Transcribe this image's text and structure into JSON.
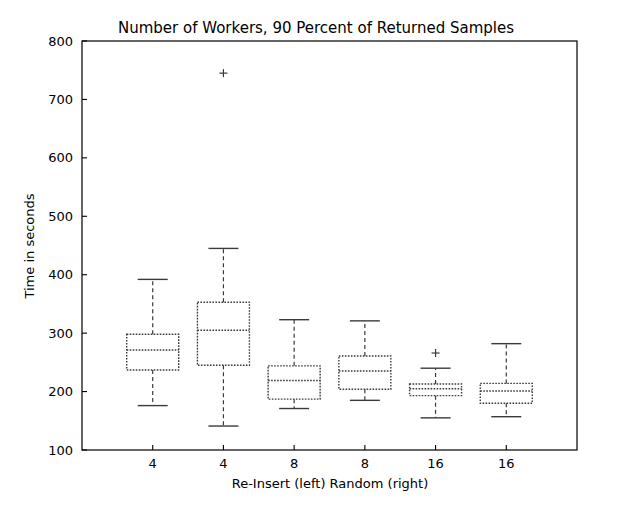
{
  "chart_data": {
    "type": "box",
    "title": "Number of Workers, 90 Percent of Returned Samples",
    "xlabel": "Re-Insert (left)   Random (right)",
    "ylabel": "Time in seconds",
    "ylim": [
      100,
      800
    ],
    "xlim": [
      0,
      7
    ],
    "grid": false,
    "legend": null,
    "yticks": [
      100,
      200,
      300,
      400,
      500,
      600,
      700,
      800
    ],
    "ytick_labels": [
      "100",
      "200",
      "300",
      "400",
      "500",
      "600",
      "700",
      "800"
    ],
    "xticks": [
      1,
      2,
      3,
      4,
      5,
      6
    ],
    "categories": [
      "4",
      "4",
      "8",
      "8",
      "16",
      "16"
    ],
    "xtick_labels": [
      "4",
      "4",
      "8",
      "8",
      "16",
      "16"
    ],
    "box_color": "#3a3a3a",
    "median_color": "#3a3a3a",
    "whisker_color": "#3a3a3a",
    "outlier_marker": "+",
    "boxes": [
      {
        "label": "4",
        "group": "Re-Insert",
        "whisker_low": 176,
        "q1": 237,
        "median": 271,
        "q3": 298,
        "whisker_high": 392,
        "outliers": []
      },
      {
        "label": "4",
        "group": "Random",
        "whisker_low": 141,
        "q1": 245,
        "median": 305,
        "q3": 353,
        "whisker_high": 445,
        "outliers": [
          745
        ]
      },
      {
        "label": "8",
        "group": "Re-Insert",
        "whisker_low": 171,
        "q1": 187,
        "median": 219,
        "q3": 244,
        "whisker_high": 323,
        "outliers": []
      },
      {
        "label": "8",
        "group": "Random",
        "whisker_low": 185,
        "q1": 204,
        "median": 235,
        "q3": 261,
        "whisker_high": 321,
        "outliers": []
      },
      {
        "label": "16",
        "group": "Re-Insert",
        "whisker_low": 155,
        "q1": 193,
        "median": 205,
        "q3": 213,
        "whisker_high": 240,
        "outliers": [
          266
        ]
      },
      {
        "label": "16",
        "group": "Random",
        "whisker_low": 157,
        "q1": 180,
        "median": 201,
        "q3": 214,
        "whisker_high": 282,
        "outliers": []
      }
    ]
  }
}
